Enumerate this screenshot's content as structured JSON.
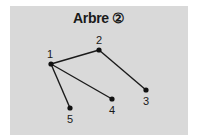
{
  "title": "Arbre ②",
  "colors": {
    "panel": "#d9d9d9",
    "edge": "#1a1a1a",
    "node": "#111111"
  },
  "nodes": [
    {
      "id": "1",
      "label": "1",
      "x": 51,
      "y": 64
    },
    {
      "id": "2",
      "label": "2",
      "x": 99,
      "y": 50
    },
    {
      "id": "3",
      "label": "3",
      "x": 146,
      "y": 90
    },
    {
      "id": "4",
      "label": "4",
      "x": 112,
      "y": 99
    },
    {
      "id": "5",
      "label": "5",
      "x": 70,
      "y": 108
    }
  ],
  "edges": [
    {
      "from": "1",
      "to": "2"
    },
    {
      "from": "2",
      "to": "3"
    },
    {
      "from": "1",
      "to": "4"
    },
    {
      "from": "1",
      "to": "5"
    }
  ]
}
